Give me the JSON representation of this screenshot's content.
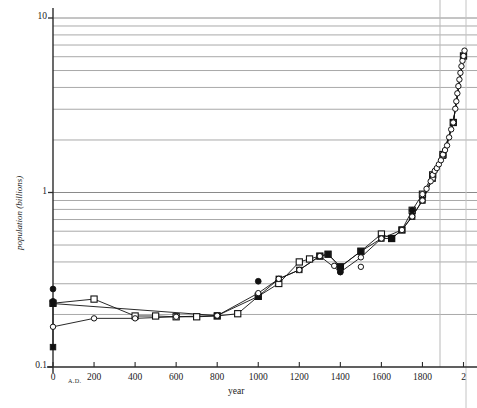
{
  "chart_data": {
    "type": "line",
    "title": "",
    "xlabel": "year",
    "ylabel": "population (billions)",
    "xlim": [
      0,
      2030
    ],
    "ylim": [
      0.1,
      10
    ],
    "yscale": "log",
    "xscale": "linear",
    "grid": "horizontal-log-minor",
    "legend": "none",
    "xticks": [
      0,
      200,
      400,
      600,
      800,
      1000,
      1200,
      1400,
      1600,
      1800,
      2000
    ],
    "xticklabels": [
      "0",
      "200",
      "400",
      "600",
      "800",
      "1000",
      "1200",
      "1400",
      "1600",
      "1800",
      "2"
    ],
    "xtick_prefix": "A.D.",
    "yticks": [
      0.1,
      1,
      10
    ],
    "yticklabels": [
      "0.1",
      "1",
      "10"
    ],
    "ygridlines": [
      0.2,
      0.3,
      0.4,
      0.5,
      0.6,
      0.7,
      0.8,
      0.9,
      1,
      2,
      3,
      4,
      5,
      6,
      7,
      8,
      9,
      10
    ],
    "annotations": [
      {
        "text": "vertical reference line",
        "x": 1850
      },
      {
        "text": "plot frame right edge",
        "x": 2000
      }
    ],
    "series": [
      {
        "name": "estimate-open-square",
        "marker": "open-square",
        "line": true,
        "color": "#111111",
        "points": [
          {
            "x": 0,
            "y": 0.232
          },
          {
            "x": 200,
            "y": 0.245
          },
          {
            "x": 400,
            "y": 0.196
          },
          {
            "x": 500,
            "y": 0.196
          },
          {
            "x": 600,
            "y": 0.194
          },
          {
            "x": 700,
            "y": 0.194
          },
          {
            "x": 800,
            "y": 0.196
          },
          {
            "x": 900,
            "y": 0.202
          },
          {
            "x": 1000,
            "y": 0.254
          },
          {
            "x": 1100,
            "y": 0.301
          },
          {
            "x": 1200,
            "y": 0.4
          },
          {
            "x": 1250,
            "y": 0.416
          },
          {
            "x": 1300,
            "y": 0.432
          },
          {
            "x": 1340,
            "y": 0.443
          },
          {
            "x": 1400,
            "y": 0.375
          },
          {
            "x": 1500,
            "y": 0.461
          },
          {
            "x": 1600,
            "y": 0.578
          },
          {
            "x": 1650,
            "y": 0.545
          },
          {
            "x": 1700,
            "y": 0.61
          },
          {
            "x": 1750,
            "y": 0.791
          },
          {
            "x": 1800,
            "y": 0.978
          },
          {
            "x": 1850,
            "y": 1.262
          },
          {
            "x": 1900,
            "y": 1.65
          },
          {
            "x": 1950,
            "y": 2.519
          },
          {
            "x": 2000,
            "y": 6.06
          }
        ]
      },
      {
        "name": "estimate-filled-square",
        "marker": "filled-square",
        "line": true,
        "color": "#111111",
        "points": [
          {
            "x": 0,
            "y": 0.13
          },
          {
            "x": 0,
            "y": 0.231
          },
          {
            "x": 800,
            "y": 0.197
          },
          {
            "x": 1000,
            "y": 0.254
          },
          {
            "x": 1100,
            "y": 0.32
          },
          {
            "x": 1200,
            "y": 0.36
          },
          {
            "x": 1300,
            "y": 0.432
          },
          {
            "x": 1340,
            "y": 0.443
          },
          {
            "x": 1400,
            "y": 0.375
          },
          {
            "x": 1500,
            "y": 0.46
          },
          {
            "x": 1600,
            "y": 0.545
          },
          {
            "x": 1650,
            "y": 0.545
          },
          {
            "x": 1700,
            "y": 0.61
          },
          {
            "x": 1750,
            "y": 0.728
          },
          {
            "x": 1800,
            "y": 0.9
          },
          {
            "x": 1850,
            "y": 1.2
          },
          {
            "x": 1900,
            "y": 1.625
          },
          {
            "x": 1950,
            "y": 2.52
          },
          {
            "x": 2000,
            "y": 6.06
          }
        ]
      },
      {
        "name": "estimate-open-circle",
        "marker": "open-circle",
        "line": true,
        "color": "#111111",
        "points": [
          {
            "x": 0,
            "y": 0.17
          },
          {
            "x": 200,
            "y": 0.19
          },
          {
            "x": 400,
            "y": 0.19
          },
          {
            "x": 600,
            "y": 0.194
          },
          {
            "x": 800,
            "y": 0.197
          },
          {
            "x": 1000,
            "y": 0.265
          },
          {
            "x": 1100,
            "y": 0.32
          },
          {
            "x": 1200,
            "y": 0.36
          },
          {
            "x": 1300,
            "y": 0.432
          },
          {
            "x": 1400,
            "y": 0.35
          },
          {
            "x": 1500,
            "y": 0.425
          },
          {
            "x": 1600,
            "y": 0.545
          },
          {
            "x": 1700,
            "y": 0.61
          },
          {
            "x": 1750,
            "y": 0.728
          },
          {
            "x": 1800,
            "y": 0.9
          },
          {
            "x": 1850,
            "y": 1.2
          },
          {
            "x": 1900,
            "y": 1.625
          },
          {
            "x": 1950,
            "y": 2.52
          },
          {
            "x": 2000,
            "y": 6.06
          }
        ]
      },
      {
        "name": "outlier-filled-circle",
        "marker": "filled-circle",
        "line": false,
        "color": "#111111",
        "points": [
          {
            "x": 0,
            "y": 0.28
          },
          {
            "x": 0,
            "y": 0.238
          },
          {
            "x": 1000,
            "y": 0.31
          },
          {
            "x": 1400,
            "y": 0.35
          },
          {
            "x": 1650,
            "y": 0.545
          },
          {
            "x": 1750,
            "y": 0.791
          }
        ]
      },
      {
        "name": "outlier-open-circle",
        "marker": "open-circle",
        "line": false,
        "color": "#111111",
        "points": [
          {
            "x": 1370,
            "y": 0.38
          },
          {
            "x": 1500,
            "y": 0.375
          }
        ]
      },
      {
        "name": "modern-dense-open-circle",
        "marker": "open-circle",
        "line": true,
        "color": "#111111",
        "points": [
          {
            "x": 1800,
            "y": 0.978
          },
          {
            "x": 1820,
            "y": 1.05
          },
          {
            "x": 1840,
            "y": 1.16
          },
          {
            "x": 1850,
            "y": 1.262
          },
          {
            "x": 1860,
            "y": 1.33
          },
          {
            "x": 1870,
            "y": 1.38
          },
          {
            "x": 1880,
            "y": 1.45
          },
          {
            "x": 1890,
            "y": 1.53
          },
          {
            "x": 1900,
            "y": 1.65
          },
          {
            "x": 1910,
            "y": 1.75
          },
          {
            "x": 1920,
            "y": 1.86
          },
          {
            "x": 1930,
            "y": 2.07
          },
          {
            "x": 1940,
            "y": 2.3
          },
          {
            "x": 1950,
            "y": 2.519
          },
          {
            "x": 1960,
            "y": 3.02
          },
          {
            "x": 1965,
            "y": 3.33
          },
          {
            "x": 1970,
            "y": 3.7
          },
          {
            "x": 1975,
            "y": 4.07
          },
          {
            "x": 1980,
            "y": 4.44
          },
          {
            "x": 1985,
            "y": 4.85
          },
          {
            "x": 1990,
            "y": 5.29
          },
          {
            "x": 1995,
            "y": 5.69
          },
          {
            "x": 2000,
            "y": 6.06
          },
          {
            "x": 2005,
            "y": 6.5
          }
        ]
      }
    ]
  },
  "axes": {
    "xlabel": "year",
    "ylabel": "population (billions)",
    "ad_marker": "A.D."
  }
}
